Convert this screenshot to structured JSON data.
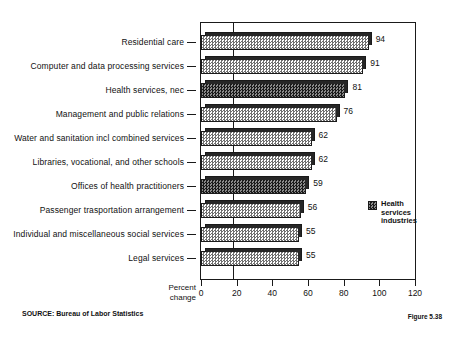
{
  "chart_data": {
    "type": "bar",
    "orientation": "horizontal",
    "title": "",
    "xlabel": "Percent change",
    "ylabel": "",
    "xlim": [
      0,
      120
    ],
    "xticks": [
      0,
      20,
      40,
      60,
      80,
      100,
      120
    ],
    "grid": false,
    "reference_line_x": 20,
    "legend": {
      "position": "right-middle",
      "entries": [
        {
          "label": "Health\nservices\nindustries",
          "pattern": "dark-dither"
        }
      ]
    },
    "categories": [
      "Residential care",
      "Computer and data processing services",
      "Health services, nec",
      "Management and public relations",
      "Water and sanitation incl combined services",
      "Libraries, vocational, and other schools",
      "Offices of health practitioners",
      "Passenger trasportation arrangement",
      "Individual and miscellaneous social services",
      "Legal services"
    ],
    "values": [
      94,
      91,
      81,
      76,
      62,
      62,
      59,
      56,
      55,
      55
    ],
    "highlight": [
      false,
      false,
      true,
      false,
      false,
      false,
      true,
      false,
      false,
      false
    ],
    "value_labels": [
      "94",
      "91",
      "81",
      "76",
      "62",
      "62",
      "59",
      "56",
      "55",
      "55"
    ]
  },
  "axis": {
    "percent_change_line1": "Percent",
    "percent_change_line2": "change"
  },
  "footer": {
    "source": "SOURCE:  Bureau of Labor Statistics",
    "figure": "Figure 5.38"
  },
  "title_sliver": ""
}
